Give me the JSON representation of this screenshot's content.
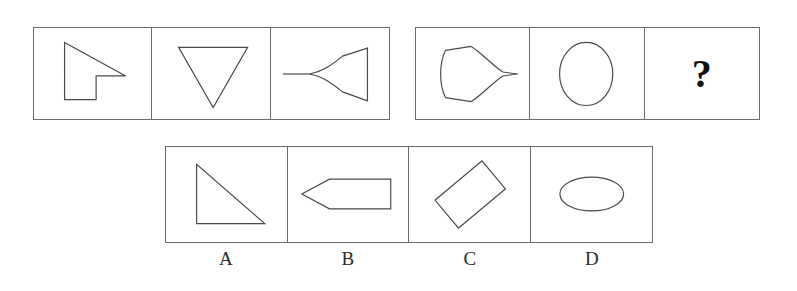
{
  "puzzle": {
    "type": "visual-analogy-shape-sequence",
    "question_mark": "?",
    "sequence_left": {
      "name": "first-sequence-group",
      "cells": [
        {
          "id": "seq-left-1",
          "shape_name": "arrow-flag-polygon",
          "description": "concave polygon resembling a cursor or flag with a notch at lower right",
          "points": "30,12 30,72 62,72 62,46 92,46"
        },
        {
          "id": "seq-left-2",
          "shape_name": "downward-triangle",
          "description": "inverted triangle pointing down",
          "points": "24,18 100,18 62,78"
        },
        {
          "id": "seq-left-3",
          "shape_name": "curved-funnel-with-tail",
          "description": "wedge with concave left sides meeting a point, with a horizontal tail to the left",
          "tail": "8,46 36,46"
        }
      ]
    },
    "sequence_right": {
      "name": "second-sequence-group",
      "cells": [
        {
          "id": "seq-right-1",
          "shape_name": "rounded-blob-with-tail",
          "description": "rounded rectangle-ish blob whose right side tapers into a sharp point with tail"
        },
        {
          "id": "seq-right-2",
          "shape_name": "vertical-ellipse",
          "description": "upright oval, taller than wide",
          "rx": 27,
          "ry": 32
        },
        {
          "id": "seq-right-3",
          "shape_name": "question-mark-cell",
          "description": "unknown answer cell showing a question mark"
        }
      ]
    },
    "options": {
      "name": "answer-options-group",
      "items": [
        {
          "key": "A",
          "label": "A",
          "shape_name": "right-triangle",
          "description": "right triangle with vertical left leg and horizontal bottom leg",
          "points": "30,16 30,74 98,74"
        },
        {
          "key": "B",
          "label": "B",
          "shape_name": "left-pointing-arrow-pentagon",
          "description": "elongated pentagon pointing left",
          "points": "10,46 40,30 100,30 100,62 40,62"
        },
        {
          "key": "C",
          "label": "C",
          "shape_name": "tilted-rectangle",
          "description": "rectangle rotated about 40 degrees counter-clockwise",
          "rotation_deg": -40
        },
        {
          "key": "D",
          "label": "D",
          "shape_name": "horizontal-ellipse",
          "description": "wide oval, wider than tall",
          "rx": 32,
          "ry": 17
        }
      ]
    }
  },
  "style": {
    "stroke_color": "#4a4a4a",
    "frame_color": "#6b6b6b",
    "background": "#ffffff",
    "text_color": "#2b2b2b"
  }
}
